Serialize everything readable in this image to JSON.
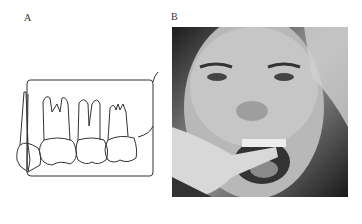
{
  "figure": {
    "panels": [
      {
        "label": "A",
        "type": "line-drawing",
        "subject": "molar teeth with bite-wing film outline"
      },
      {
        "label": "B",
        "type": "photograph",
        "subject": "patient with film held in mouth for bite-wing radiograph"
      }
    ]
  },
  "colors": {
    "ink": "#333333",
    "background": "#ffffff"
  }
}
